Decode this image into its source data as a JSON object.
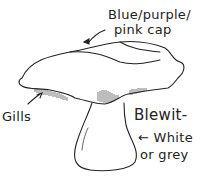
{
  "diagram": {
    "labels": {
      "cap_line1": "Blue/purple/",
      "cap_line2": "pink cap",
      "gills": "Gills",
      "name": "Blewit-",
      "stem_line1": "← White",
      "stem_line2": "or grey"
    },
    "colors": {
      "ink": "#222222",
      "background": "#ffffff"
    }
  }
}
